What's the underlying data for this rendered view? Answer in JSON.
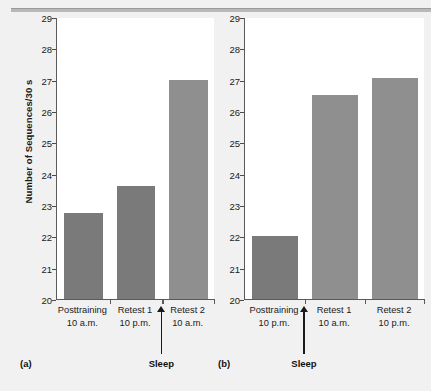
{
  "figure": {
    "background_color": "#f1f1f1",
    "plot_background_color": "#ffffff",
    "axis_color": "#5a5a5a",
    "bar_color_before_sleep": "#7a7a7a",
    "bar_color_after_sleep": "#8f8f8f"
  },
  "chart_data": [
    {
      "type": "bar",
      "panel": "a",
      "panel_label": "(a)",
      "title": "",
      "xlabel": "",
      "ylabel": "Number of Sequences/30 s",
      "ylim": [
        20,
        29
      ],
      "yticks": [
        20,
        21,
        22,
        23,
        24,
        25,
        26,
        27,
        28,
        29
      ],
      "ytick_labels": [
        "20",
        "21",
        "22",
        "23",
        "24",
        "25",
        "26",
        "27",
        "28",
        "29"
      ],
      "grid": false,
      "legend": "none",
      "categories": [
        "Posttraining",
        "Retest 1",
        "Retest 2"
      ],
      "category_times": [
        "10 a.m.",
        "10 p.m.",
        "10 a.m."
      ],
      "values": [
        22.75,
        23.6,
        27.0
      ],
      "bar_colors": [
        "#7a7a7a",
        "#7a7a7a",
        "#8f8f8f"
      ],
      "annotations": [
        {
          "text": "Sleep",
          "type": "arrow-up",
          "between_categories": [
            "Retest 1",
            "Retest 2"
          ]
        }
      ]
    },
    {
      "type": "bar",
      "panel": "b",
      "panel_label": "(b)",
      "title": "",
      "xlabel": "",
      "ylabel": "",
      "ylim": [
        20,
        29
      ],
      "yticks": [
        20,
        21,
        22,
        23,
        24,
        25,
        26,
        27,
        28,
        29
      ],
      "ytick_labels": [
        "20",
        "21",
        "22",
        "23",
        "24",
        "25",
        "26",
        "27",
        "28",
        "29"
      ],
      "grid": false,
      "legend": "none",
      "categories": [
        "Posttraining",
        "Retest 1",
        "Retest 2"
      ],
      "category_times": [
        "10 p.m.",
        "10 a.m.",
        "10 p.m."
      ],
      "values": [
        22.0,
        26.5,
        27.05
      ],
      "bar_colors": [
        "#7a7a7a",
        "#8f8f8f",
        "#8f8f8f"
      ],
      "annotations": [
        {
          "text": "Sleep",
          "type": "arrow-up",
          "between_categories": [
            "Posttraining",
            "Retest 1"
          ]
        }
      ]
    }
  ]
}
